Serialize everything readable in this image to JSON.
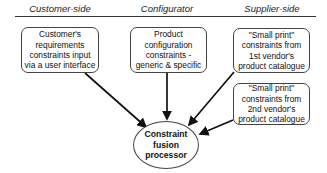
{
  "columns": [
    {
      "label": "Customer-side"
    },
    {
      "label": "Configurator"
    },
    {
      "label": "Supplier-side"
    }
  ],
  "nodes": {
    "customer_requirements": "Customer's\nrequirements\nconstraints input\nvia a user interface",
    "product_configuration": "Product\nconfiguration\nconstraints -\ngeneric & specific",
    "vendor1_small_print": "\"Small print\"\nconstraints from\n1st vendor's\nproduct catalogue",
    "vendor2_small_print": "\"Small print\"\nconstraints from\n2nd vendor's\nproduct catalogue",
    "fusion_processor": "Constraint\nfusion\nprocessor"
  },
  "edges": [
    {
      "from": "customer_requirements",
      "to": "fusion_processor"
    },
    {
      "from": "product_configuration",
      "to": "fusion_processor"
    },
    {
      "from": "vendor1_small_print",
      "to": "fusion_processor"
    },
    {
      "from": "vendor2_small_print",
      "to": "fusion_processor"
    }
  ]
}
